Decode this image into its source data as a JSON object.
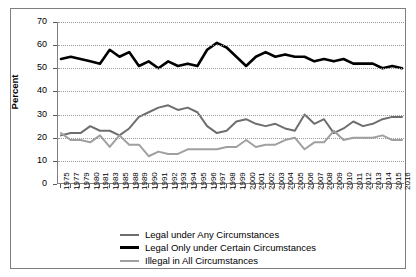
{
  "chart_data": {
    "type": "line",
    "title": "",
    "xlabel": "",
    "ylabel": "Percent",
    "ylim": [
      0,
      70
    ],
    "ytick_step": 10,
    "yticks": [
      0,
      10,
      20,
      30,
      40,
      50,
      60,
      70
    ],
    "grid": true,
    "legend_position": "bottom",
    "categories": [
      "1975",
      "1977",
      "1979",
      "1980",
      "1981",
      "1983",
      "1985",
      "1988",
      "1989",
      "1990",
      "1991",
      "1992",
      "1993",
      "1994",
      "1995",
      "1996",
      "1997",
      "1998",
      "1999",
      "2000",
      "2001",
      "2002",
      "2003",
      "2004",
      "2005",
      "2006",
      "2007",
      "2008",
      "2009",
      "2010",
      "2011",
      "2012",
      "2013",
      "2014",
      "2015",
      "2016"
    ],
    "series": [
      {
        "name": "Legal under Any Circumstances",
        "color": "#6e6e6e",
        "values": [
          21,
          22,
          22,
          25,
          23,
          23,
          21,
          24,
          29,
          31,
          33,
          34,
          32,
          33,
          31,
          25,
          22,
          23,
          27,
          28,
          26,
          25,
          26,
          24,
          23,
          30,
          26,
          28,
          22,
          24,
          27,
          25,
          26,
          28,
          29,
          29
        ]
      },
      {
        "name": "Legal Only under Certain Circumstances",
        "color": "#000000",
        "values": [
          54,
          55,
          54,
          53,
          52,
          58,
          55,
          57,
          51,
          53,
          50,
          53,
          51,
          52,
          51,
          58,
          61,
          59,
          55,
          51,
          55,
          57,
          55,
          56,
          55,
          55,
          53,
          54,
          53,
          54,
          52,
          52,
          52,
          50,
          51,
          50
        ]
      },
      {
        "name": "Illegal in All Circumstances",
        "color": "#a0a0a0",
        "values": [
          22,
          19,
          19,
          18,
          21,
          16,
          21,
          17,
          17,
          12,
          14,
          13,
          13,
          15,
          15,
          15,
          15,
          16,
          16,
          19,
          16,
          17,
          17,
          19,
          20,
          15,
          18,
          18,
          23,
          19,
          20,
          20,
          20,
          21,
          19,
          19
        ]
      }
    ]
  },
  "legend": {
    "items": [
      {
        "label": "Legal under Any Circumstances",
        "color": "#6e6e6e",
        "thickness": 2
      },
      {
        "label": "Legal Only under Certain Circumstances",
        "color": "#000000",
        "thickness": 3
      },
      {
        "label": "Illegal in All Circumstances",
        "color": "#a0a0a0",
        "thickness": 2
      }
    ]
  }
}
